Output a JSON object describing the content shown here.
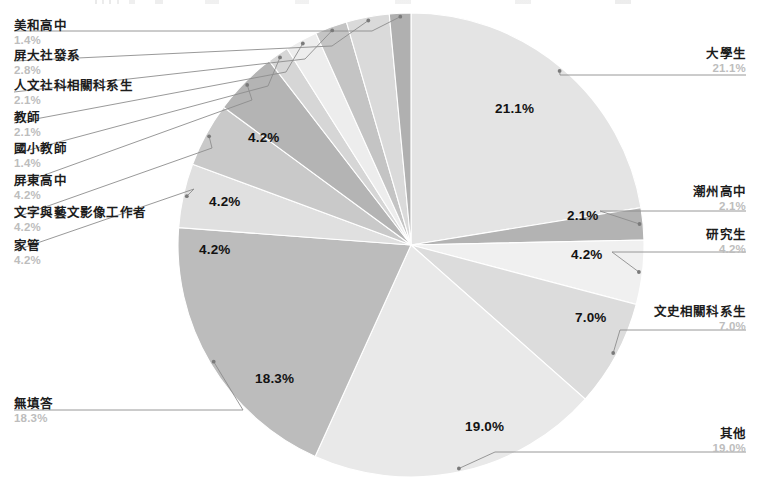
{
  "chart_data": {
    "type": "pie",
    "title": "",
    "subtitle": "",
    "xlabel": "",
    "ylabel": "",
    "legend_position": "callout-labels",
    "grid": false,
    "value_unit": "%",
    "start_angle_deg": 0,
    "direction": "clockwise",
    "categories": [
      "大學生",
      "潮州高中",
      "研究生",
      "文史相關科系生",
      "其他",
      "無填答",
      "家管",
      "文字與藝文影像工作者",
      "屏東高中",
      "國小教師",
      "教師",
      "人文社科相關科系生",
      "屏大社發系",
      "美和高中"
    ],
    "values": [
      21.1,
      2.1,
      4.2,
      7.0,
      19.0,
      18.3,
      4.2,
      4.2,
      4.2,
      1.4,
      2.1,
      2.1,
      2.8,
      1.4
    ],
    "value_labels": [
      "21.1%",
      "2.1%",
      "4.2%",
      "7.0%",
      "19.0%",
      "18.3%",
      "4.2%",
      "4.2%",
      "4.2%",
      "1.4%",
      "2.1%",
      "2.1%",
      "2.8%",
      "1.4%"
    ],
    "colors": [
      "#e4e4e4",
      "#b3b3b3",
      "#f0f0f0",
      "#dcdcdc",
      "#e9e9e9",
      "#bcbcbc",
      "#e0e0e0",
      "#c9c9c9",
      "#b4b4b4",
      "#d6d6d6",
      "#ededed",
      "#c4c4c4",
      "#dadada",
      "#b0b0b0"
    ],
    "slice_labels_shown_in_pie": [
      "21.1%",
      "2.1%",
      "4.2%",
      "7.0%",
      "19.0%",
      "18.3%",
      "4.2%",
      "4.2%",
      "4.2%"
    ]
  },
  "slices": {
    "daxuesheng": {
      "label": "大學生",
      "value": "21.1%"
    },
    "chaozhou": {
      "label": "潮州高中",
      "value": "2.1%"
    },
    "yanjiusheng": {
      "label": "研究生",
      "value": "4.2%"
    },
    "wenshi": {
      "label": "文史相關科系生",
      "value": "7.0%"
    },
    "qita": {
      "label": "其他",
      "value": "19.0%"
    },
    "wutianda": {
      "label": "無填答",
      "value": "18.3%"
    },
    "jiaguan": {
      "label": "家管",
      "value": "4.2%"
    },
    "wenzi": {
      "label": "文字與藝文影像工作者",
      "value": "4.2%"
    },
    "pingdong": {
      "label": "屏東高中",
      "value": "4.2%"
    },
    "guoxiao": {
      "label": "國小教師",
      "value": "1.4%"
    },
    "jiaoshi": {
      "label": "教師",
      "value": "2.1%"
    },
    "renwen": {
      "label": "人文社科相關科系生",
      "value": "2.1%"
    },
    "pingda": {
      "label": "屏大社發系",
      "value": "2.8%"
    },
    "meihe": {
      "label": "美和高中",
      "value": "1.4%"
    }
  },
  "pie_percent_texts": {
    "p_21_1": "21.1%",
    "p_2_1": "2.1%",
    "p_4_2_yanjiusheng": "4.2%",
    "p_7_0": "7.0%",
    "p_19_0": "19.0%",
    "p_18_3": "18.3%",
    "p_4_2_a": "4.2%",
    "p_4_2_b": "4.2%",
    "p_4_2_c": "4.2%"
  }
}
